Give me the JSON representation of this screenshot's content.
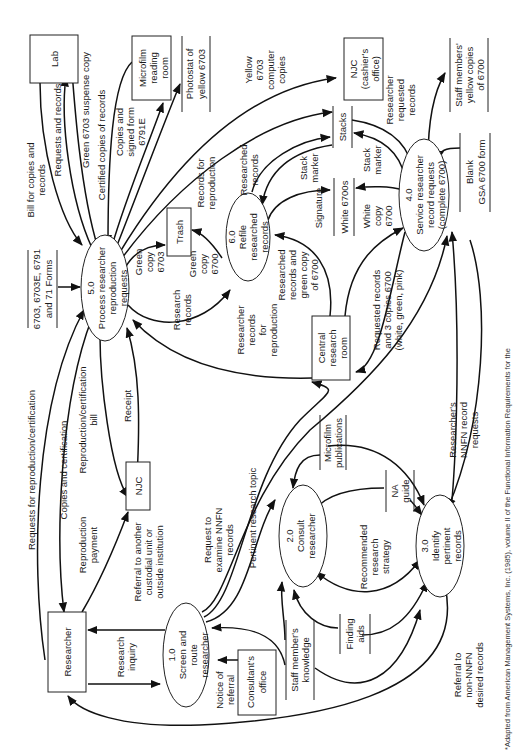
{
  "diagram": {
    "orientation": "rotated 90 degrees counterclockwise",
    "processes": [
      {
        "id": "1.0",
        "lines": [
          "1.0",
          "Screen and",
          "route",
          "researcher"
        ]
      },
      {
        "id": "2.0",
        "lines": [
          "2.0",
          "Consult",
          "researcher"
        ]
      },
      {
        "id": "3.0",
        "lines": [
          "3.0",
          "Identify",
          "pertinent",
          "records"
        ]
      },
      {
        "id": "4.0",
        "lines": [
          "4.0",
          "Service researcher",
          "record requests",
          "(complete 6700)"
        ]
      },
      {
        "id": "5.0",
        "lines": [
          "5.0",
          "Process researcher",
          "reproduction",
          "requests"
        ]
      },
      {
        "id": "6.0",
        "lines": [
          "6.0",
          "Refile",
          "researched",
          "records"
        ]
      }
    ],
    "entities": [
      {
        "id": "lab",
        "lines": [
          "Lab"
        ]
      },
      {
        "id": "microfilm-reading-room",
        "lines": [
          "Microfilm",
          "reading",
          "room"
        ]
      },
      {
        "id": "trash",
        "lines": [
          "Trash"
        ]
      },
      {
        "id": "njc-cashier",
        "lines": [
          "NJC",
          "(cashier's",
          "office)"
        ]
      },
      {
        "id": "central-research-room",
        "lines": [
          "Central",
          "research",
          "room"
        ]
      },
      {
        "id": "researcher",
        "lines": [
          "Researcher"
        ]
      },
      {
        "id": "njc",
        "lines": [
          "NJC"
        ]
      },
      {
        "id": "consultants-office",
        "lines": [
          "Consultant's",
          "office"
        ]
      }
    ],
    "stores": [
      {
        "id": "forms",
        "lines": [
          "6703, 6703E, 6791",
          "and 71 Forms"
        ]
      },
      {
        "id": "photostat",
        "lines": [
          "Photostat of",
          "yellow 6703"
        ]
      },
      {
        "id": "stacks",
        "lines": [
          "Stacks"
        ]
      },
      {
        "id": "staff-yellow",
        "lines": [
          "Staff members'",
          "yellow copies",
          "of 6700"
        ]
      },
      {
        "id": "white-6700s",
        "lines": [
          "White 6700s"
        ]
      },
      {
        "id": "blank-gsa",
        "lines": [
          "Blank",
          "GSA 6700 form"
        ]
      },
      {
        "id": "microfilm-publications",
        "lines": [
          "Microfilm",
          "publications"
        ]
      },
      {
        "id": "na-guide",
        "lines": [
          "NA",
          "guide"
        ]
      },
      {
        "id": "finding-aids",
        "lines": [
          "Finding",
          "aids"
        ]
      },
      {
        "id": "staff-knowledge",
        "lines": [
          "Staff member's",
          "knowledge"
        ]
      }
    ],
    "flows": [
      {
        "id": "f1",
        "lines": [
          "Bill for copies and",
          "records"
        ]
      },
      {
        "id": "f2",
        "lines": [
          "Requests and records"
        ]
      },
      {
        "id": "f3",
        "lines": [
          "Green 6703 suspense copy"
        ]
      },
      {
        "id": "f4",
        "lines": [
          "Certified copies of records"
        ]
      },
      {
        "id": "f5",
        "lines": [
          "Copies and",
          "signed form",
          "6791E"
        ]
      },
      {
        "id": "f6",
        "lines": [
          "Yellow",
          "6703",
          "computer",
          "copies"
        ]
      },
      {
        "id": "f7",
        "lines": [
          "Records for",
          "reproduction"
        ]
      },
      {
        "id": "f8",
        "lines": [
          "Researched",
          "records"
        ]
      },
      {
        "id": "f9",
        "lines": [
          "Researcher",
          "requested",
          "records"
        ]
      },
      {
        "id": "f10",
        "lines": [
          "Stack",
          "marker"
        ]
      },
      {
        "id": "f11",
        "lines": [
          "Stack",
          "marker"
        ]
      },
      {
        "id": "f12",
        "lines": [
          "Signature"
        ]
      },
      {
        "id": "f13",
        "lines": [
          "White",
          "copy",
          "6700"
        ]
      },
      {
        "id": "f14",
        "lines": [
          "Green",
          "copy",
          "6703"
        ]
      },
      {
        "id": "f15",
        "lines": [
          "Green",
          "copy",
          "6700"
        ]
      },
      {
        "id": "f16",
        "lines": [
          "Research",
          "records"
        ]
      },
      {
        "id": "f17",
        "lines": [
          "Researched",
          "records and",
          "green copy",
          "of 6700"
        ]
      },
      {
        "id": "f18",
        "lines": [
          "Researcher",
          "records",
          "for",
          "reproduction"
        ]
      },
      {
        "id": "f19",
        "lines": [
          "Requested records",
          "and 3 copies 6700",
          "(white, green, pink)"
        ]
      },
      {
        "id": "f20",
        "lines": [
          "Requests for reproduction/certification"
        ]
      },
      {
        "id": "f21",
        "lines": [
          "Copies and certification"
        ]
      },
      {
        "id": "f22",
        "lines": [
          "Reproduction/certification",
          "bill"
        ]
      },
      {
        "id": "f23",
        "lines": [
          "Receipt"
        ]
      },
      {
        "id": "f24",
        "lines": [
          "Reproduction",
          "payment"
        ]
      },
      {
        "id": "f25",
        "lines": [
          "Referral to another",
          "custodial unit or",
          "outside institution"
        ]
      },
      {
        "id": "f26",
        "lines": [
          "Request to",
          "examine NNFN",
          "records"
        ]
      },
      {
        "id": "f27",
        "lines": [
          "Pertinent research topic"
        ]
      },
      {
        "id": "f28",
        "lines": [
          "Researcher's",
          "NNFN record",
          "requests"
        ]
      },
      {
        "id": "f29",
        "lines": [
          "Recommended",
          "research",
          "strategy"
        ]
      },
      {
        "id": "f30",
        "lines": [
          "Research",
          "inquiry"
        ]
      },
      {
        "id": "f31",
        "lines": [
          "Notice of",
          "referral"
        ]
      },
      {
        "id": "f32",
        "lines": [
          "Referral to",
          "non-NNFN",
          "desired records"
        ]
      }
    ],
    "footnote": {
      "prefix": "*Adapted from American Management Systems, Inc. (1985), volume II of the ",
      "italic": "Functional Information Requirements for the"
    }
  }
}
